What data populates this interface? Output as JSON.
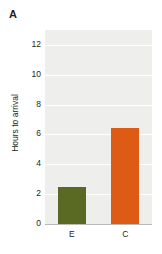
{
  "panel": {
    "label": "A"
  },
  "chart_data": {
    "type": "bar",
    "title": "",
    "xlabel": "",
    "ylabel": "Hours to arrival",
    "categories": [
      "E",
      "C"
    ],
    "values": [
      2.5,
      6.45
    ],
    "series": [
      {
        "name": "Hours to arrival",
        "values": [
          2.5,
          6.45
        ]
      }
    ],
    "ylim": [
      0,
      13
    ],
    "yticks": [
      0,
      2,
      4,
      6,
      8,
      10,
      12
    ],
    "ytick_labels": [
      "0",
      "2",
      "4",
      "6",
      "8",
      "10",
      "12"
    ],
    "grid": true,
    "grid_axis": "y",
    "legend": "none",
    "bar_colors": [
      "#5a6a22",
      "#de5b15"
    ],
    "plot_background": "#eeeeec",
    "gridline_color": "#ffffff",
    "axis_color": "#b9b9b6",
    "text_color": "#231f20"
  }
}
